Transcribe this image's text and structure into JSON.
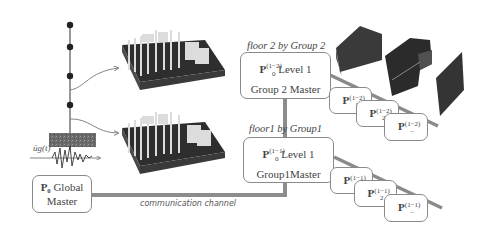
{
  "structure": {
    "ground_motion_label": "üg(t)"
  },
  "global_master": {
    "processor": "P₀",
    "line1_rest": "Global",
    "line2": "Master"
  },
  "channel": {
    "label": "communication channel"
  },
  "groups": [
    {
      "floor_label": "floor 2 by Group 2",
      "master": {
        "processor": "P",
        "superscript": "(1−2)",
        "subscript": "0",
        "level": "Level 1",
        "title": "Group 2 Master"
      },
      "workers": [
        {
          "processor": "P",
          "superscript": "(1−2)",
          "subscript": "1"
        },
        {
          "processor": "P",
          "superscript": "(1−2)",
          "subscript": "2"
        },
        {
          "processor": "P",
          "superscript": "(1−2)",
          "subscript": "–"
        }
      ]
    },
    {
      "floor_label": "floor1 by Group1",
      "master": {
        "processor": "P",
        "superscript": "(1−1)",
        "subscript": "0",
        "level": "Level 1",
        "title": "Group1Master"
      },
      "workers": [
        {
          "processor": "P",
          "superscript": "(1−1)",
          "subscript": "1"
        },
        {
          "processor": "P",
          "superscript": "(1−1)",
          "subscript": "2"
        },
        {
          "processor": "P",
          "superscript": "(1−1)",
          "subscript": "–"
        }
      ]
    }
  ],
  "colors": {
    "channel": "#8c8c8c",
    "building_dark": "#2e2e2e",
    "building_light": "#d9d9d9",
    "box_border": "#8a8a8a"
  }
}
